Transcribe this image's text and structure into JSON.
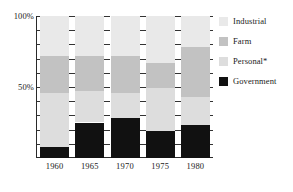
{
  "chart_data": {
    "type": "bar",
    "subtype": "stacked-100-percent",
    "title": "",
    "xlabel": "",
    "ylabel": "",
    "categories": [
      "1960",
      "1965",
      "1970",
      "1975",
      "1980"
    ],
    "ylim": [
      0,
      100
    ],
    "ytick_values": [
      0,
      10,
      20,
      30,
      40,
      50,
      60,
      70,
      80,
      90,
      100
    ],
    "ytick_labels": [
      "",
      "",
      "",
      "",
      "",
      "50%",
      "",
      "",
      "",
      "",
      "100%"
    ],
    "labeled_yticks": [
      {
        "value": 100,
        "label": "100%"
      },
      {
        "value": 50,
        "label": "50%"
      }
    ],
    "grid": true,
    "grid_style": "dashed-horizontal",
    "legend_position": "right",
    "series": [
      {
        "name": "Government",
        "color": "#111111",
        "values": [
          8,
          25,
          28,
          19,
          23
        ]
      },
      {
        "name": "Personal*",
        "color": "#dddddd",
        "values": [
          38,
          22,
          18,
          30,
          20
        ]
      },
      {
        "name": "Farm",
        "color": "#c2c2c2",
        "values": [
          26,
          25,
          26,
          18,
          35
        ]
      },
      {
        "name": "Industrial",
        "color": "#e9e9e9",
        "values": [
          28,
          28,
          28,
          33,
          22
        ]
      }
    ],
    "stack_order_bottom_to_top": [
      "Government",
      "Personal*",
      "Farm",
      "Industrial"
    ],
    "legend_order_top_to_bottom": [
      "Industrial",
      "Farm",
      "Personal*",
      "Government"
    ],
    "annotations": [
      "* asterisk on Personal indicates a footnote"
    ]
  },
  "legend": {
    "items": [
      {
        "label": "Industrial",
        "color": "#e9e9e9"
      },
      {
        "label": "Farm",
        "color": "#c2c2c2"
      },
      {
        "label": "Personal*",
        "color": "#dddddd"
      },
      {
        "label": "Government",
        "color": "#111111"
      }
    ]
  },
  "colors": {
    "industrial": "#e9e9e9",
    "farm": "#c2c2c2",
    "personal": "#dddddd",
    "government": "#111111",
    "axis": "#2a2a2a",
    "text": "#1a1a1a",
    "background": "#ffffff"
  }
}
